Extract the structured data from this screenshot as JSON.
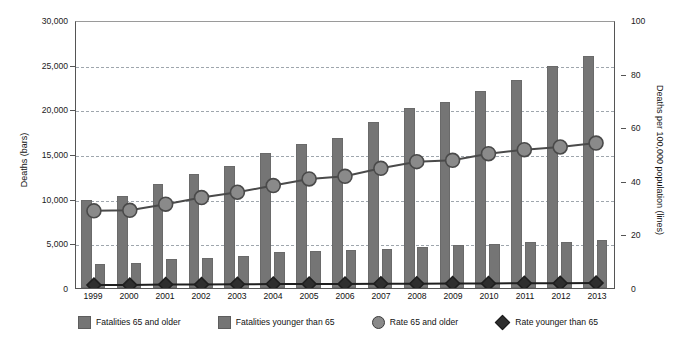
{
  "title": "Fall deaths and death rates, 1999-2013",
  "axes": {
    "left_title": "Deaths (bars)",
    "right_title": "Deaths per 100,000 population (lines)",
    "left_ticks": [
      "30,000",
      "25,000",
      "20,000",
      "15,000",
      "10,000",
      "5,000",
      "0"
    ],
    "right_ticks": [
      "100",
      "80",
      "60",
      "40",
      "20",
      "0"
    ]
  },
  "legend": [
    {
      "label": "Fatalities 65 and older",
      "marker": "square-swatch-icon",
      "color": "#757575"
    },
    {
      "label": "Fatalities younger than 65",
      "marker": "square-swatch-icon",
      "color": "#757575"
    },
    {
      "label": "Rate 65 and older",
      "marker": "circle-marker-icon",
      "color": "#8a8a8a"
    },
    {
      "label": "Rate younger than 65",
      "marker": "diamond-marker-icon",
      "color": "#2e2e2e"
    }
  ],
  "chart_data": {
    "type": "bar",
    "title": "Fall deaths and death rates, 1999-2013",
    "categories": [
      "1999",
      "2000",
      "2001",
      "2002",
      "2003",
      "2004",
      "2005",
      "2006",
      "2007",
      "2008",
      "2009",
      "2010",
      "2011",
      "2012",
      "2013"
    ],
    "xlabel": "",
    "ylabel": "Deaths (bars)",
    "y2label": "Deaths per 100,000 population (lines)",
    "ylim": [
      0,
      30000
    ],
    "y2lim": [
      0,
      100
    ],
    "ytick_step": 5000,
    "y2tick_step": 20,
    "grid": true,
    "legend_position": "bottom",
    "series": [
      {
        "name": "Fatalities 65 and older",
        "axis": "left",
        "kind": "bar",
        "values": [
          9900,
          10300,
          11600,
          12800,
          13700,
          15100,
          16100,
          16800,
          18600,
          20100,
          20800,
          22100,
          23300,
          24800,
          26000
        ]
      },
      {
        "name": "Fatalities younger than 65",
        "axis": "left",
        "kind": "bar",
        "values": [
          2700,
          2800,
          3200,
          3400,
          3600,
          4000,
          4100,
          4200,
          4400,
          4600,
          4800,
          4900,
          5100,
          5200,
          5400
        ]
      },
      {
        "name": "Rate 65 and older",
        "axis": "right",
        "kind": "line",
        "marker": "circle",
        "values": [
          29.0,
          29.2,
          31.5,
          34.0,
          36.0,
          38.5,
          41.0,
          42.0,
          45.0,
          47.5,
          48.0,
          50.5,
          52.0,
          53.0,
          54.5
        ]
      },
      {
        "name": "Rate younger than 65",
        "axis": "right",
        "kind": "line",
        "marker": "diamond",
        "values": [
          1.1,
          1.1,
          1.3,
          1.3,
          1.4,
          1.5,
          1.5,
          1.5,
          1.6,
          1.6,
          1.7,
          1.7,
          1.8,
          1.8,
          1.9
        ]
      }
    ]
  }
}
